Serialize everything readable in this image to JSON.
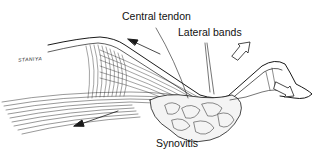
{
  "figure": {
    "labels": {
      "central_tendon": "Central tendon",
      "lateral_bands": "Lateral bands",
      "synovitis": "Synovitis"
    },
    "signature": "STANIYA",
    "colors": {
      "ink": "#1a1a1a",
      "background": "#ffffff",
      "stipple": "#777777"
    }
  }
}
